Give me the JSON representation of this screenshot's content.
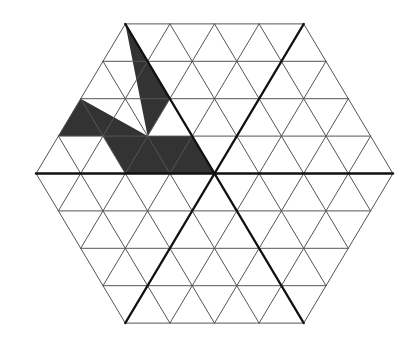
{
  "diagram": {
    "type": "hexagonal-triangle-grid",
    "grid": {
      "side_cells": 4,
      "center": [
        214.5,
        173.5
      ],
      "cell_width": 44.6,
      "row_height": 37.4,
      "thin_line_color": "#555555",
      "thick_line_color": "#111111"
    },
    "thick_lines": [
      [
        [
          36,
          173.5
        ],
        [
          393,
          173.5
        ]
      ],
      [
        [
          125.3,
          24
        ],
        [
          303.7,
          323
        ]
      ],
      [
        [
          303.7,
          24
        ],
        [
          125.3,
          323
        ]
      ]
    ],
    "shaded_color": "#333333",
    "shaded_regions": [
      {
        "name": "sliver",
        "points": [
          [
            125.3,
            24
          ],
          [
            169.9,
            98.8
          ],
          [
            147.6,
            136.1
          ]
        ]
      },
      {
        "name": "main",
        "points": [
          [
            80.7,
            98.8
          ],
          [
            147.6,
            136.1
          ],
          [
            192.2,
            136.1
          ],
          [
            214.5,
            173.5
          ],
          [
            125.3,
            173.5
          ],
          [
            103,
            136.1
          ],
          [
            58.3,
            136.1
          ]
        ]
      }
    ]
  }
}
